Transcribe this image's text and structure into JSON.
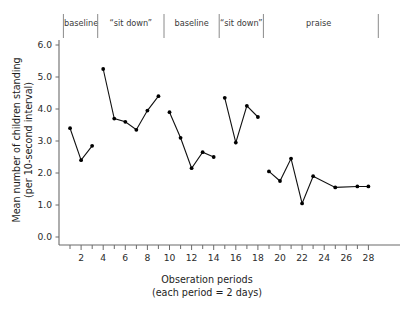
{
  "chart_data": {
    "type": "line",
    "title": "",
    "xlabel": "Obseration periods",
    "xlabel_sub": "(each period = 2 days)",
    "ylabel_line1": "Mean number of children standing",
    "ylabel_line2": "(per 10-second interval)",
    "xlim": [
      0,
      29
    ],
    "ylim": [
      0,
      6.4
    ],
    "grid": false,
    "legend_position": "none",
    "ytick_labels": [
      "0.0",
      "1.0",
      "2.0",
      "3.0",
      "4.0",
      "5.0",
      "6.0"
    ],
    "ytick_values": [
      0,
      1,
      2,
      3,
      4,
      5,
      6
    ],
    "xtick_labels": [
      "2",
      "4",
      "6",
      "8",
      "10",
      "12",
      "14",
      "16",
      "18",
      "20",
      "22",
      "24",
      "26",
      "28"
    ],
    "xtick_values": [
      2,
      4,
      6,
      8,
      10,
      12,
      14,
      16,
      18,
      20,
      22,
      24,
      26,
      28
    ],
    "xtick_minor_values": [
      1,
      3,
      5,
      7,
      9,
      11,
      13,
      15,
      17,
      19,
      21,
      23,
      25,
      27
    ],
    "phases": [
      {
        "label": "baseline",
        "start": 1,
        "end": 3
      },
      {
        "label": "“sit down”",
        "start": 4,
        "end": 9
      },
      {
        "label": "baseline",
        "start": 10,
        "end": 14
      },
      {
        "label": "“sit down”",
        "start": 15,
        "end": 18
      },
      {
        "label": "praise",
        "start": 19,
        "end": 28
      }
    ],
    "phase_divider_positions": [
      0.4,
      3.5,
      9.5,
      14.5,
      18.5,
      28.9
    ],
    "series": [
      {
        "name": "baseline-1",
        "x": [
          1,
          2,
          3
        ],
        "values": [
          3.4,
          2.4,
          2.85
        ]
      },
      {
        "name": "sit-down-1",
        "x": [
          4,
          5,
          6,
          7,
          8,
          9
        ],
        "values": [
          5.25,
          3.7,
          3.6,
          3.35,
          3.95,
          4.4
        ]
      },
      {
        "name": "baseline-2",
        "x": [
          10,
          11,
          12,
          13,
          14
        ],
        "values": [
          3.9,
          3.1,
          2.15,
          2.65,
          2.5
        ]
      },
      {
        "name": "sit-down-2",
        "x": [
          15,
          16,
          17,
          18
        ],
        "values": [
          4.35,
          2.95,
          4.1,
          3.75
        ]
      },
      {
        "name": "praise",
        "x": [
          19,
          20,
          21,
          22,
          23,
          25,
          27,
          28
        ],
        "values": [
          2.05,
          1.75,
          2.45,
          1.05,
          1.9,
          1.55,
          1.58,
          1.58
        ]
      }
    ]
  }
}
